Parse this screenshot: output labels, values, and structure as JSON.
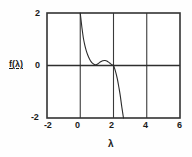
{
  "chart_data": {
    "type": "line",
    "title": "",
    "subtitle": "",
    "xlabel": "λ",
    "ylabel": "f(λ)",
    "xlim": [
      -2,
      6
    ],
    "ylim": [
      -2,
      2
    ],
    "grid": true,
    "legend": null,
    "xticks": [
      "-2",
      "0",
      "2",
      "4",
      "6"
    ],
    "xtick_values": [
      -2,
      0,
      2,
      4,
      6
    ],
    "yticks": [
      "2",
      "0",
      "-2"
    ],
    "ytick_values": [
      2,
      0,
      -2
    ],
    "series": [
      {
        "name": "f(λ)",
        "color": "#2b2b2b",
        "x": [
          0.0,
          0.05,
          0.1,
          0.15,
          0.2,
          0.28,
          0.36,
          0.45,
          0.55,
          0.65,
          0.75,
          0.85,
          0.95,
          1.05,
          1.2,
          1.35,
          1.5,
          1.6,
          1.7,
          1.8,
          1.9,
          2.0,
          2.08,
          2.16,
          2.24,
          2.32,
          2.4,
          2.5,
          2.6
        ],
        "y": [
          2.0,
          1.72,
          1.45,
          1.21,
          1.0,
          0.76,
          0.57,
          0.4,
          0.26,
          0.15,
          0.08,
          0.04,
          0.03,
          0.06,
          0.13,
          0.18,
          0.19,
          0.17,
          0.13,
          0.08,
          0.03,
          0.0,
          -0.14,
          -0.32,
          -0.54,
          -0.82,
          -1.12,
          -1.58,
          -2.0
        ]
      }
    ],
    "annotations": []
  },
  "axes": {
    "y_title": "f(λ)",
    "x_title": "λ",
    "x_tick_labels": [
      "-2",
      "0",
      "2",
      "4",
      "6"
    ],
    "y_tick_labels": [
      "2",
      "0",
      "-2"
    ]
  },
  "style": {
    "background": "#fefefe",
    "line_color": "#2b2b2b",
    "frame_color": "#333333",
    "grid_color": "#3a3a3a",
    "text_color": "#1a1a1a"
  }
}
